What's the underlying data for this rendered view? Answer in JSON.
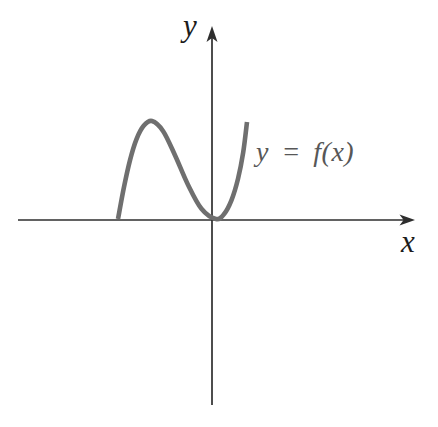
{
  "figure": {
    "y_axis_label": "y",
    "x_axis_label": "x",
    "curve_label": "y = f(x)",
    "background_color": "#ffffff",
    "axis_color": "#2e2e2e",
    "axis_label_color": "#1c1c1c",
    "curve_color": "#6f6f6f",
    "curve_label_color": "#575757"
  },
  "chart_data": {
    "type": "line",
    "title": "",
    "xlabel": "x",
    "ylabel": "y",
    "grid": false,
    "legend": "none",
    "tick_labels": "none",
    "x_range": [
      -2.05,
      2.13
    ],
    "y_range": [
      -1.89,
      1.98
    ],
    "annotations": [
      {
        "text": "y = f(x)",
        "x": 0.47,
        "y": 0.64,
        "align": "left"
      }
    ],
    "features": {
      "x_intercept_crossing": -1.0,
      "local_maximum": {
        "x": -0.64,
        "y": 1.01
      },
      "local_minimum_touching_x_axis": {
        "x": 0.03,
        "y": 0.01
      },
      "shape": "cubic-like: rises from x-intercept at x = -1 to a local maximum, falls to touch the x-axis near the origin (local minimum), then rises steeply for x > 0"
    },
    "series": [
      {
        "name": "y = f(x)",
        "points": [
          [
            -1.0,
            0.0102
          ],
          [
            -0.9375,
            0.3337
          ],
          [
            -0.874,
            0.6091
          ],
          [
            -0.806,
            0.8228
          ],
          [
            -0.7299,
            0.961
          ],
          [
            -0.6421,
            1.0102
          ],
          [
            -0.5245,
            0.9062
          ],
          [
            -0.3989,
            0.6582
          ],
          [
            -0.2646,
            0.3622
          ],
          [
            -0.1214,
            0.1142
          ],
          [
            0.0316,
            0.0102
          ],
          [
            0.1171,
            0.0612
          ],
          [
            0.1949,
            0.2029
          ],
          [
            0.2627,
            0.418
          ],
          [
            0.3179,
            0.6894
          ],
          [
            0.3579,
            1.0
          ]
        ]
      }
    ]
  }
}
